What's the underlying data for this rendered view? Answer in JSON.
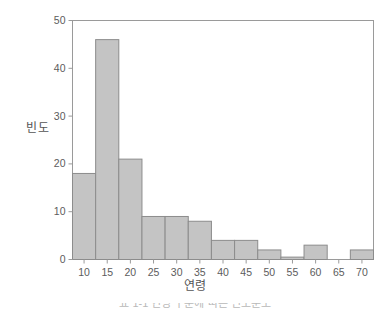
{
  "chart_data": {
    "type": "bar",
    "title": "",
    "subtitle": "",
    "xlabel": "연령",
    "ylabel": "빈도",
    "xlim": [
      7.5,
      72.5
    ],
    "ylim": [
      0,
      50
    ],
    "grid": false,
    "legend": null,
    "bin_width": 5,
    "bin_edges": [
      7.5,
      12.5,
      17.5,
      22.5,
      27.5,
      32.5,
      37.5,
      42.5,
      47.5,
      52.5,
      57.5,
      62.5,
      67.5,
      72.5
    ],
    "categories": [
      "7.5-12.5",
      "12.5-17.5",
      "17.5-22.5",
      "22.5-27.5",
      "27.5-32.5",
      "32.5-37.5",
      "37.5-42.5",
      "42.5-47.5",
      "47.5-52.5",
      "52.5-57.5",
      "57.5-62.5",
      "62.5-67.5",
      "67.5-72.5"
    ],
    "values": [
      18,
      46,
      21,
      9,
      9,
      8,
      4,
      4,
      2,
      0.5,
      3,
      0,
      2
    ],
    "x_ticks": [
      10,
      15,
      20,
      25,
      30,
      35,
      40,
      45,
      50,
      55,
      60,
      65,
      70
    ],
    "x_tick_labels": [
      "10",
      "15",
      "20",
      "25",
      "30",
      "35",
      "40",
      "45",
      "50",
      "55",
      "60",
      "65",
      "70"
    ],
    "y_ticks": [
      0,
      10,
      20,
      30,
      40,
      50
    ],
    "y_tick_labels": [
      "0",
      "10",
      "20",
      "30",
      "40",
      "50"
    ],
    "bar_fill_color": "#c4c4c4",
    "bar_edge_color": "#8c8c8c",
    "axis_color": "#9a9a9a",
    "text_color": "#5c5c5c",
    "background_color": "#ffffff"
  },
  "caption": {
    "text": "표 1-1  연령 구분에 따른 빈도분포"
  }
}
